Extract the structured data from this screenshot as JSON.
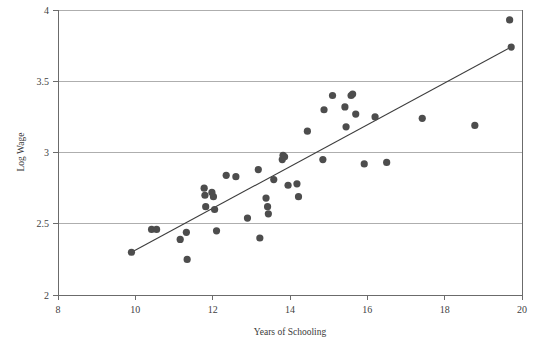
{
  "chart_data": {
    "type": "scatter",
    "title": "",
    "xlabel": "Years of Schooling",
    "ylabel": "Log Wage",
    "xlim": [
      8,
      20
    ],
    "ylim": [
      2,
      4
    ],
    "xticks": [
      "8",
      "10",
      "12",
      "14",
      "16",
      "18",
      "20"
    ],
    "xtick_values": [
      8,
      10,
      12,
      14,
      16,
      18,
      20
    ],
    "yticks": [
      "2",
      "2.5",
      "3",
      "3.5",
      "4"
    ],
    "ytick_values": [
      2,
      2.5,
      3,
      3.5,
      4
    ],
    "grid": "horizontal",
    "legend": null,
    "marker_color": "#4d4d4d",
    "line_color": "#3d3d3d",
    "axis_color": "#6b6b6b",
    "grid_color": "#9a9a9a",
    "marker_radius": 3.6,
    "points": [
      [
        9.9,
        2.3
      ],
      [
        10.42,
        2.46
      ],
      [
        10.55,
        2.46
      ],
      [
        11.16,
        2.39
      ],
      [
        11.32,
        2.44
      ],
      [
        11.34,
        2.25
      ],
      [
        11.78,
        2.75
      ],
      [
        11.8,
        2.7
      ],
      [
        11.82,
        2.62
      ],
      [
        11.98,
        2.72
      ],
      [
        12.02,
        2.69
      ],
      [
        12.05,
        2.6
      ],
      [
        12.1,
        2.45
      ],
      [
        12.35,
        2.84
      ],
      [
        12.6,
        2.83
      ],
      [
        12.9,
        2.54
      ],
      [
        13.18,
        2.88
      ],
      [
        13.22,
        2.4
      ],
      [
        13.38,
        2.68
      ],
      [
        13.42,
        2.62
      ],
      [
        13.44,
        2.57
      ],
      [
        13.58,
        2.81
      ],
      [
        13.8,
        2.95
      ],
      [
        13.82,
        2.98
      ],
      [
        13.86,
        2.97
      ],
      [
        13.95,
        2.77
      ],
      [
        14.18,
        2.78
      ],
      [
        14.22,
        2.69
      ],
      [
        14.45,
        3.15
      ],
      [
        14.85,
        2.95
      ],
      [
        14.88,
        3.3
      ],
      [
        15.1,
        3.4
      ],
      [
        15.42,
        3.32
      ],
      [
        15.45,
        3.18
      ],
      [
        15.58,
        3.4
      ],
      [
        15.62,
        3.41
      ],
      [
        15.7,
        3.27
      ],
      [
        15.92,
        2.92
      ],
      [
        16.2,
        3.25
      ],
      [
        16.5,
        2.93
      ],
      [
        17.42,
        3.24
      ],
      [
        18.78,
        3.19
      ],
      [
        19.68,
        3.93
      ],
      [
        19.72,
        3.74
      ]
    ],
    "fit_line": {
      "x0": 9.9,
      "y0": 2.3,
      "x1": 19.72,
      "y1": 3.74
    }
  }
}
